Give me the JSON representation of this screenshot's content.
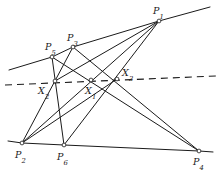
{
  "figure": {
    "width": 219,
    "height": 174,
    "background": "#ffffff",
    "stroke_color": "#1a1a1a",
    "stroke_width": 1.0,
    "vertex_marker": "open-circle"
  },
  "points": [
    {
      "id": "P1",
      "base": "P",
      "sub": "1",
      "x": 159,
      "y": 21,
      "label_x": 153,
      "label_y": 6,
      "marker": true
    },
    {
      "id": "P5",
      "base": "P",
      "sub": "5",
      "x": 52,
      "y": 57,
      "label_x": 45,
      "label_y": 42,
      "marker": true
    },
    {
      "id": "P3",
      "base": "P",
      "sub": "3",
      "x": 73,
      "y": 47,
      "label_x": 67,
      "label_y": 33,
      "marker": true
    },
    {
      "id": "X2",
      "base": "X",
      "sub": "2",
      "x": 55,
      "y": 81,
      "label_x": 38,
      "label_y": 86,
      "marker": true
    },
    {
      "id": "X1",
      "base": "X",
      "sub": "1",
      "x": 91,
      "y": 80,
      "label_x": 85,
      "label_y": 86,
      "marker": true
    },
    {
      "id": "X3",
      "base": "X",
      "sub": "3",
      "x": 117,
      "y": 79,
      "label_x": 122,
      "label_y": 68,
      "marker": true
    },
    {
      "id": "P2",
      "base": "P",
      "sub": "2",
      "x": 22,
      "y": 143,
      "label_x": 15,
      "label_y": 150,
      "marker": true
    },
    {
      "id": "P6",
      "base": "P",
      "sub": "6",
      "x": 64,
      "y": 145,
      "label_x": 57,
      "label_y": 152,
      "marker": true
    },
    {
      "id": "P4",
      "base": "P",
      "sub": "4",
      "x": 199,
      "y": 151,
      "label_x": 193,
      "label_y": 157,
      "marker": true
    }
  ],
  "solid_segments": [
    {
      "name": "upper-line-left",
      "x1": 9,
      "y1": 70,
      "x2": 52,
      "y2": 57
    },
    {
      "name": "upper-line-P5-P3",
      "x1": 52,
      "y1": 57,
      "x2": 73,
      "y2": 47
    },
    {
      "name": "upper-line-P3-P1",
      "x1": 73,
      "y1": 47,
      "x2": 159,
      "y2": 21
    },
    {
      "name": "upper-line-right",
      "x1": 159,
      "y1": 21,
      "x2": 210,
      "y2": 7
    },
    {
      "name": "lower-line-left",
      "x1": 8,
      "y1": 141,
      "x2": 22,
      "y2": 143
    },
    {
      "name": "lower-line-P2-P6",
      "x1": 22,
      "y1": 143,
      "x2": 64,
      "y2": 145
    },
    {
      "name": "lower-line-P6-P4",
      "x1": 64,
      "y1": 145,
      "x2": 199,
      "y2": 151
    },
    {
      "name": "lower-line-right",
      "x1": 199,
      "y1": 151,
      "x2": 213,
      "y2": 152
    },
    {
      "name": "P1-P2",
      "x1": 159,
      "y1": 21,
      "x2": 22,
      "y2": 143
    },
    {
      "name": "P1-P6",
      "x1": 159,
      "y1": 21,
      "x2": 64,
      "y2": 145
    },
    {
      "name": "P1-X2",
      "x1": 159,
      "y1": 21,
      "x2": 55,
      "y2": 81
    },
    {
      "name": "P3-P2",
      "x1": 73,
      "y1": 47,
      "x2": 22,
      "y2": 143
    },
    {
      "name": "P3-P4",
      "x1": 73,
      "y1": 47,
      "x2": 199,
      "y2": 151
    },
    {
      "name": "P5-P6",
      "x1": 52,
      "y1": 57,
      "x2": 64,
      "y2": 145
    },
    {
      "name": "P5-P4",
      "x1": 52,
      "y1": 57,
      "x2": 199,
      "y2": 151
    },
    {
      "name": "P2-X3-up",
      "x1": 22,
      "y1": 143,
      "x2": 117,
      "y2": 79
    }
  ],
  "dashed_line": {
    "name": "axis-of-perspectivity",
    "x1": 5,
    "y1": 85,
    "x2": 216,
    "y2": 76,
    "dash_pattern": "7 5"
  },
  "point_labels": {
    "P1": "P1",
    "P2": "P2",
    "P3": "P3",
    "P4": "P4",
    "P5": "P5",
    "P6": "P6",
    "X1": "X1",
    "X2": "X2",
    "X3": "X3"
  }
}
